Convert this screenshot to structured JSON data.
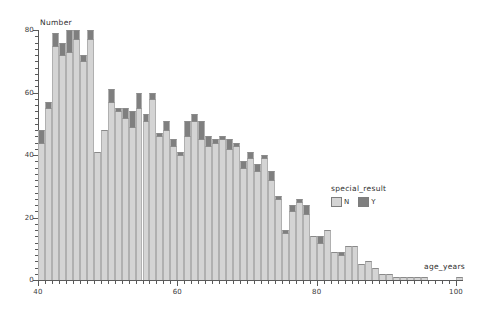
{
  "chart_data": {
    "type": "bar",
    "subtype": "stacked-histogram",
    "title": "",
    "xlabel": "age_years",
    "ylabel": "Number",
    "xlim": [
      40,
      101
    ],
    "ylim": [
      0,
      80
    ],
    "x_ticks": [
      40,
      60,
      80,
      100
    ],
    "y_ticks": [
      0,
      20,
      40,
      60,
      80
    ],
    "x_tick_labels": [
      "40",
      "60",
      "80",
      "100"
    ],
    "y_tick_labels": [
      "0",
      "20",
      "40",
      "60",
      "80"
    ],
    "grid": false,
    "bin_width": 1,
    "legend": {
      "title": "special_result",
      "position": "right-middle",
      "entries": [
        {
          "label": "N",
          "color": "#d4d4d4"
        },
        {
          "label": "Y",
          "color": "#7f7f7f"
        }
      ]
    },
    "categories": [
      40,
      41,
      42,
      43,
      44,
      45,
      46,
      47,
      48,
      49,
      50,
      51,
      52,
      53,
      54,
      55,
      56,
      57,
      58,
      59,
      60,
      61,
      62,
      63,
      64,
      65,
      66,
      67,
      68,
      69,
      70,
      71,
      72,
      73,
      74,
      75,
      76,
      77,
      78,
      79,
      80,
      81,
      82,
      83,
      84,
      85,
      86,
      87,
      88,
      89,
      90,
      91,
      92,
      93,
      94,
      95,
      96,
      97,
      98,
      99,
      100
    ],
    "series": [
      {
        "name": "N",
        "color": "#d4d4d4",
        "values": [
          44,
          55,
          75,
          72,
          73,
          77,
          70,
          77,
          41,
          48,
          57,
          54,
          52,
          49,
          55,
          51,
          58,
          46,
          48,
          43,
          40,
          46,
          51,
          45,
          43,
          44,
          45,
          42,
          43,
          36,
          39,
          35,
          39,
          32,
          26,
          15,
          22,
          25,
          21,
          14,
          12,
          16,
          9,
          8,
          11,
          11,
          5,
          6,
          4,
          2,
          2,
          1,
          1,
          1,
          1,
          1,
          0,
          0,
          0,
          0,
          1
        ]
      },
      {
        "name": "Y",
        "color": "#7f7f7f",
        "values": [
          4,
          2,
          4,
          4,
          7,
          3,
          2,
          3,
          0,
          0,
          4,
          1,
          3,
          5,
          5,
          2,
          2,
          1,
          3,
          2,
          1,
          5,
          2,
          6,
          3,
          1,
          1,
          3,
          1,
          2,
          2,
          2,
          1,
          3,
          1,
          1,
          2,
          1,
          3,
          0,
          2,
          0,
          0,
          1,
          0,
          0,
          0,
          0,
          0,
          0,
          0,
          0,
          0,
          0,
          0,
          0,
          0,
          0,
          0,
          0,
          0
        ]
      }
    ]
  }
}
